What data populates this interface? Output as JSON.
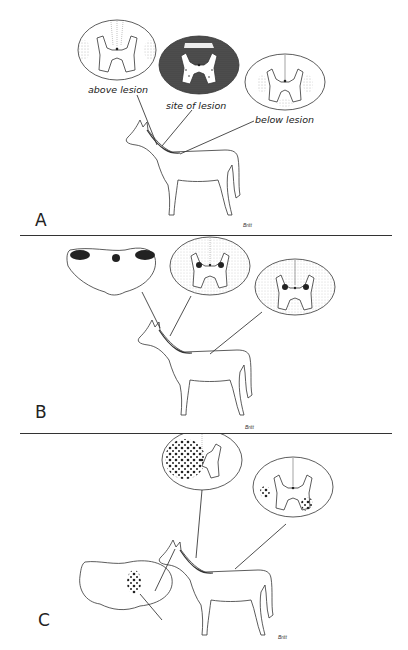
{
  "figure": {
    "panels": [
      {
        "letter": "A",
        "labels": {
          "above": "above lesion",
          "site": "site of lesion",
          "below": "below lesion"
        }
      },
      {
        "letter": "B"
      },
      {
        "letter": "C"
      }
    ],
    "signature": "Britt"
  }
}
